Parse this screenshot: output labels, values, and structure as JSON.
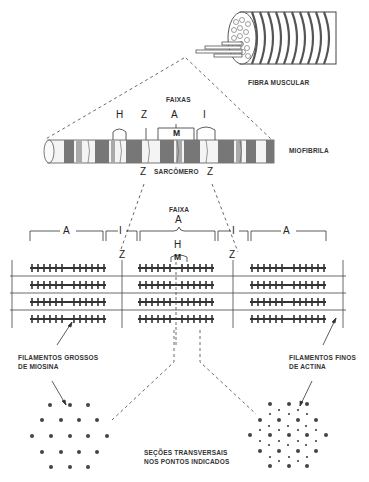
{
  "labels": {
    "fibra_muscular": "FIBRA MUSCULAR",
    "faixas": "FAIXAS",
    "faixas_letters": [
      "H",
      "Z",
      "A",
      "I"
    ],
    "m_top": "M",
    "miofibrila": "MIOFIBRILA",
    "z_left": "Z",
    "sarcomero": "SARCÔMERO",
    "z_right": "Z",
    "faixa": "FAIXA",
    "band_a_center": "A",
    "band_a_left": "A",
    "band_i_left": "I",
    "band_i_right": "I",
    "band_a_right": "A",
    "band_h": "H",
    "band_m": "M",
    "z_line_left": "Z",
    "z_line_right": "Z",
    "thick_filaments_line1": "FILAMENTOS GROSSOS",
    "thick_filaments_line2": "DE MIOSINA",
    "thin_filaments_line1": "FILAMENTOS FINOS",
    "thin_filaments_line2": "DE ACTINA",
    "cross_sections_line1": "SEÇÕES TRANSVERSAIS",
    "cross_sections_line2": "NOS PONTOS INDICADOS"
  },
  "colors": {
    "ink": "#333333",
    "light_band": "#f2f2f2",
    "dark_band": "#7a7a7a"
  }
}
